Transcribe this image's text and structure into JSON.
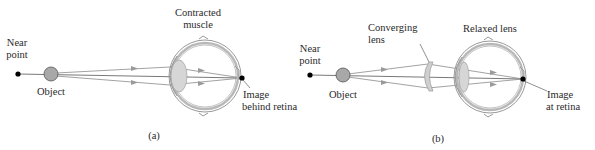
{
  "panel_a": {
    "caption": "(a)",
    "near_point_label": [
      "Near",
      "point"
    ],
    "object_label": "Object",
    "muscle_label": [
      "Contracted",
      "muscle"
    ],
    "image_label": [
      "Image",
      "behind retina"
    ]
  },
  "panel_b": {
    "caption": "(b)",
    "near_point_label": [
      "Near",
      "point"
    ],
    "object_label": "Object",
    "lens_label": [
      "Converging",
      "lens"
    ],
    "eye_lens_label": "Relaxed lens",
    "image_label": [
      "Image",
      "at retina"
    ]
  },
  "colors": {
    "object_fill": "#a8a8a8",
    "lens_fill": "#d6d6d6",
    "ray": "#8a8a8a",
    "point": "#000000"
  }
}
